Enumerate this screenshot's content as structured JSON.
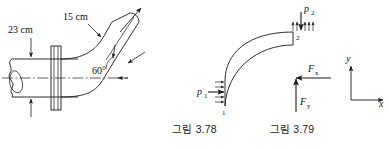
{
  "page": {
    "background": "#ffffff",
    "ink": "#1a1a1a",
    "width": 389,
    "height": 149
  },
  "figures": [
    {
      "id": "figure-3-78",
      "caption": "그림 3.78",
      "type": "pipe-bend-pictorial",
      "description": "Flanged reducing pipe bend, inlet horizontal, outlet inclined",
      "labels": [
        {
          "name": "inlet-diameter",
          "text": "23 cm",
          "points_to": "inlet pipe"
        },
        {
          "name": "outlet-diameter",
          "text": "15 cm",
          "points_to": "outlet pipe"
        },
        {
          "name": "bend-angle",
          "text": "60°",
          "points_to": "angle between centerline and outlet axis"
        }
      ]
    },
    {
      "id": "figure-3-79",
      "caption": "그림 3.79",
      "type": "control-volume-free-body",
      "description": "Curved elbow control volume with pressure and reaction forces",
      "labels": [
        {
          "name": "inlet-pressure",
          "text": "p",
          "sub": "1"
        },
        {
          "name": "outlet-pressure",
          "text": "p",
          "sub": "2"
        },
        {
          "name": "force-x",
          "text": "F",
          "sub": "x"
        },
        {
          "name": "force-y",
          "text": "F",
          "sub": "y"
        },
        {
          "name": "station-1",
          "text": "1"
        },
        {
          "name": "station-2",
          "text": "2"
        },
        {
          "name": "axis-x",
          "text": "x"
        },
        {
          "name": "axis-y",
          "text": "y"
        }
      ]
    }
  ],
  "captions": {
    "left": "그림 3.78",
    "right": "그림 3.79"
  },
  "left_figure": {
    "inlet_label": "23 cm",
    "outlet_label": "15 cm",
    "angle_label": "60°"
  },
  "right_figure": {
    "p1_base": "p",
    "p1_sub": "1",
    "p2_base": "p",
    "p2_sub": "2",
    "fx_base": "F",
    "fx_sub": "x",
    "fy_base": "F",
    "fy_sub": "y",
    "station1": "1",
    "station2": "2",
    "axis_x": "x",
    "axis_y": "y"
  }
}
